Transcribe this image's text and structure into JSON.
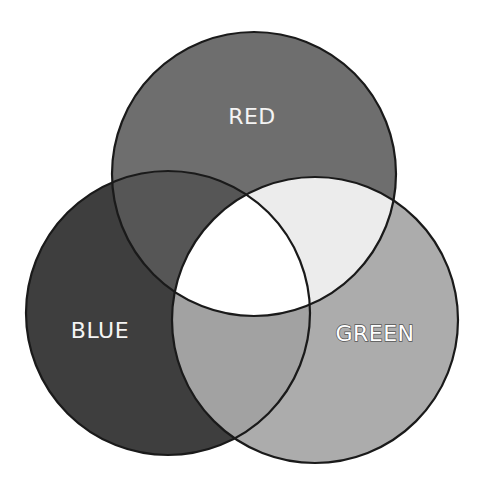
{
  "diagram": {
    "type": "venn-3",
    "canvas": {
      "width": 482,
      "height": 495,
      "background": "#ffffff"
    },
    "stroke": {
      "color": "#1a1a1a",
      "width": 2.2
    },
    "sets": [
      {
        "id": "red",
        "label": "RED",
        "cx": 254,
        "cy": 174,
        "r": 142,
        "fill": "#6e6e6e",
        "label_x": 252,
        "label_y": 124,
        "label_style": "light"
      },
      {
        "id": "blue",
        "label": "BLUE",
        "cx": 168,
        "cy": 313,
        "r": 142,
        "fill": "#3e3e3e",
        "label_x": 100,
        "label_y": 338,
        "label_style": "light"
      },
      {
        "id": "green",
        "label": "GREEN",
        "cx": 315,
        "cy": 320,
        "r": 143,
        "fill": "#acacac",
        "label_x": 375,
        "label_y": 341,
        "label_style": "outline"
      }
    ],
    "intersections": {
      "red_blue": {
        "fill": "#565656"
      },
      "red_green": {
        "fill": "#ececec"
      },
      "blue_green": {
        "fill": "#a2a2a2"
      },
      "all_three": {
        "fill": "#ffffff"
      }
    }
  }
}
